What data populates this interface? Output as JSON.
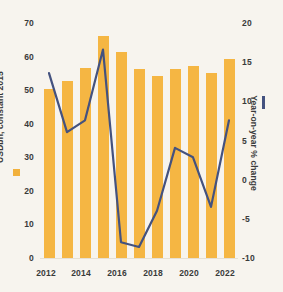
{
  "chart_data": {
    "type": "bar",
    "title": "",
    "subtitle": "",
    "xlabel": "",
    "ylabel": "USDbn, constant 2015",
    "y2label": "Year-on-year % change",
    "categories": [
      "2012",
      "2013",
      "2014",
      "2015",
      "2016",
      "2017",
      "2018",
      "2019",
      "2020",
      "2021",
      "2022"
    ],
    "x_tick_labels": [
      "2012",
      "2014",
      "2016",
      "2018",
      "2020",
      "2022"
    ],
    "y_tick_labels": [
      "70",
      "60",
      "50",
      "40",
      "30",
      "20",
      "10",
      "0"
    ],
    "y2_tick_labels": [
      "20",
      "15",
      "10",
      "5",
      "0",
      "-5",
      "-10"
    ],
    "ylim": [
      0,
      70
    ],
    "y2lim": [
      -10,
      20
    ],
    "grid": false,
    "legend_position": "axis-titles",
    "series": [
      {
        "name": "USDbn, constant 2015",
        "type": "bar",
        "axis": "left",
        "color": "#f5b643",
        "values": [
          50,
          52.5,
          56.5,
          66,
          61,
          56,
          54,
          56,
          57,
          55,
          59
        ]
      },
      {
        "name": "Year-on-year % change",
        "type": "line",
        "axis": "right",
        "color": "#44527f",
        "values": [
          13.5,
          6,
          7.5,
          16.5,
          -8,
          -8.6,
          -4,
          4,
          2.8,
          -3.5,
          7.5
        ]
      }
    ]
  },
  "axes": {
    "left_title": "USDbn, constant 2015",
    "right_title": "Year-on-year % change"
  },
  "colors": {
    "bar": "#f5b643",
    "line": "#44527f",
    "background": "#f7f4ee",
    "text": "#3a3a3a"
  }
}
